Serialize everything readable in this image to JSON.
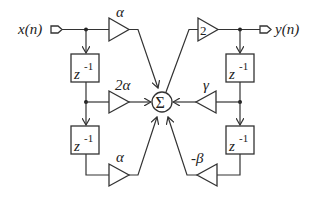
{
  "diagram": {
    "input_label": "x(n)",
    "output_label": "y(n)",
    "summer_symbol": "Σ",
    "delay_label": "z",
    "delay_exponent": "-1",
    "feedforward_gains": [
      "α",
      "2α",
      "α"
    ],
    "feedback_gains": [
      "γ",
      "-β"
    ],
    "output_gain": "2",
    "colors": {
      "line": "#333333",
      "background": "#ffffff"
    }
  }
}
